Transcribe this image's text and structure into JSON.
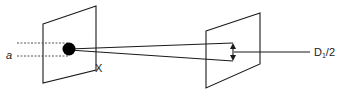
{
  "diagram": {
    "labels": {
      "aperture": "a",
      "distance": "X",
      "diameter_main": "D",
      "diameter_sub": "1",
      "diameter_tail": "/2"
    },
    "colors": {
      "stroke": "#1a1a1a",
      "dashed": "#555555",
      "dot": "#000000",
      "background": "#ffffff"
    }
  }
}
